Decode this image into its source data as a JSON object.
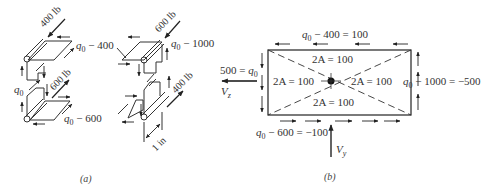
{
  "figure": {
    "panel_a": {
      "caption": "(a)",
      "loads": {
        "top_left": "400 lb",
        "mid_left": "600 lb",
        "top_right": "600 lb",
        "mid_right": "400 lb"
      },
      "labels": {
        "q_top_left": "q",
        "q_top_left_sub": "0",
        "q_top_left_rest": " − 400",
        "q_left": "q",
        "q_left_sub": "0",
        "q_bottom_left": "q",
        "q_bottom_left_sub": "0",
        "q_bottom_left_rest": " − 600",
        "q_top_right": "q",
        "q_top_right_sub": "0",
        "q_top_right_rest": " − 1000",
        "dimension": "1 in"
      }
    },
    "panel_b": {
      "caption": "(b)",
      "top_flow": {
        "q": "q",
        "sub": "0",
        "rest": " − 400 = 100"
      },
      "right_flow": {
        "q": "q",
        "sub": "0",
        "rest": " − 1000 = −500"
      },
      "bottom_flow": {
        "q": "q",
        "sub": "0",
        "rest": " − 600 = −100"
      },
      "left_flow": {
        "pre": "500 = ",
        "q": "q",
        "sub": "0"
      },
      "areas": {
        "top": "2A = 100",
        "left": "2A = 100",
        "right": "2A = 100",
        "bottom": "2A = 100"
      },
      "forces": {
        "vz": "V",
        "vz_sub": "z",
        "vy": "V",
        "vy_sub": "y"
      }
    }
  }
}
